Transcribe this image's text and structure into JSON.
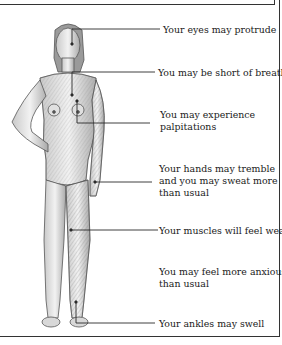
{
  "diagram": {
    "labels": [
      {
        "id": "eyes",
        "lines": [
          "Your eyes may protrude"
        ]
      },
      {
        "id": "breath",
        "lines": [
          "You may be short of breath"
        ]
      },
      {
        "id": "palpitations",
        "lines": [
          "You may experience",
          "palpitations"
        ]
      },
      {
        "id": "hands",
        "lines": [
          "Your hands may tremble",
          "and you may sweat more",
          "than usual"
        ]
      },
      {
        "id": "muscles",
        "lines": [
          "Your muscles will feel weak"
        ]
      },
      {
        "id": "anxious",
        "lines": [
          "You may feel more anxious",
          "than usual"
        ]
      },
      {
        "id": "ankles",
        "lines": [
          "Your ankles may swell"
        ]
      }
    ],
    "colors": {
      "line": "#2a2a2a",
      "border": "#333333",
      "skin_shade": "#8a8a8a"
    }
  }
}
